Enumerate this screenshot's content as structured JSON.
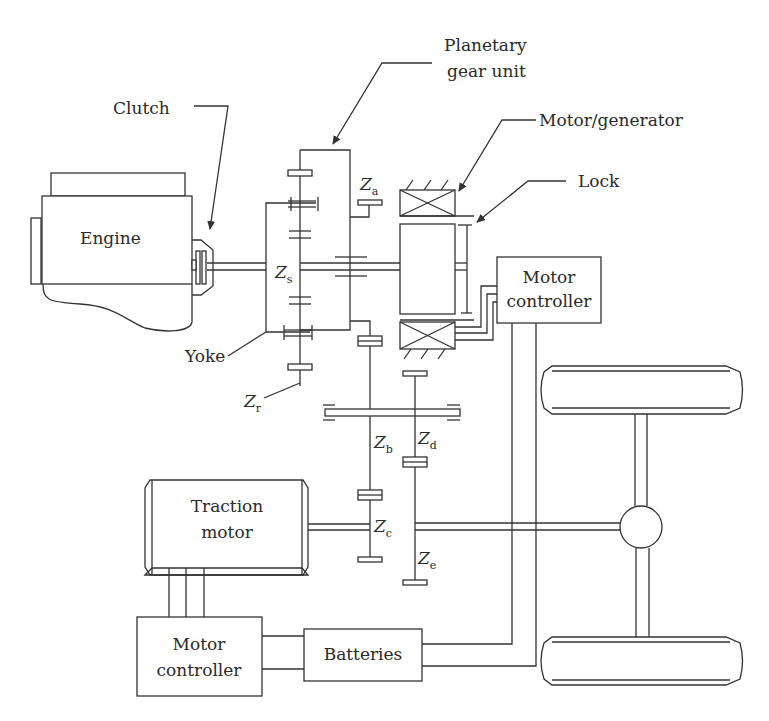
{
  "diagram": {
    "type": "hybrid powertrain schematic",
    "labels": {
      "clutch": "Clutch",
      "planetary_line1": "Planetary",
      "planetary_line2": "gear unit",
      "motor_generator": "Motor/generator",
      "lock": "Lock",
      "engine": "Engine",
      "motor_controller_top_line1": "Motor",
      "motor_controller_top_line2": "controller",
      "yoke": "Yoke",
      "traction_line1": "Traction",
      "traction_line2": "motor",
      "motor_controller_bottom_line1": "Motor",
      "motor_controller_bottom_line2": "controller",
      "batteries": "Batteries"
    },
    "gears": {
      "za": {
        "main": "Z",
        "sub": "a"
      },
      "zs": {
        "main": "Z",
        "sub": "s"
      },
      "zr": {
        "main": "Z",
        "sub": "r"
      },
      "zb": {
        "main": "Z",
        "sub": "b"
      },
      "zd": {
        "main": "Z",
        "sub": "d"
      },
      "zc": {
        "main": "Z",
        "sub": "c"
      },
      "ze": {
        "main": "Z",
        "sub": "e"
      }
    },
    "colors": {
      "line": "#333333",
      "background": "#ffffff"
    }
  }
}
